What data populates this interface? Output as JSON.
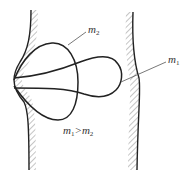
{
  "diagram": {
    "labels": {
      "m2": {
        "base": "m",
        "sub": "2"
      },
      "m1": {
        "base": "m",
        "sub": "1"
      },
      "relation": {
        "left_base": "m",
        "left_sub": "1",
        "op": ">",
        "right_base": "m",
        "right_sub": "2"
      }
    },
    "elements": [
      "left-wall-hatched",
      "right-wall-hatched",
      "lobe-m2",
      "lobe-m1",
      "leader-line-m2",
      "leader-line-m1"
    ],
    "colors": {
      "stroke": "#222222",
      "hatch": "#8a8a8a",
      "text": "#333333",
      "background": "#ffffff"
    }
  }
}
